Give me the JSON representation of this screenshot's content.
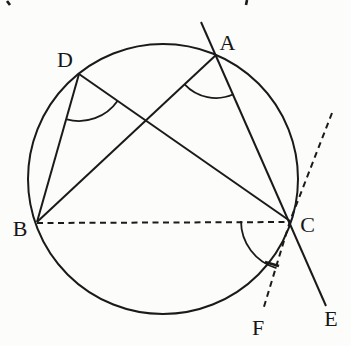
{
  "figure": {
    "background": "#fcfcfa",
    "ink": "#1a1a1a",
    "width": 351,
    "height": 346,
    "circle": {
      "cx": 163,
      "cy": 179,
      "r": 135
    },
    "points": {
      "A": {
        "x": 216,
        "y": 55
      },
      "B": {
        "x": 37,
        "y": 222
      },
      "C": {
        "x": 290,
        "y": 221
      },
      "D": {
        "x": 79,
        "y": 74
      }
    },
    "labels": [
      {
        "id": "A",
        "text": "A",
        "x": 227.5,
        "y": 42.5
      },
      {
        "id": "B",
        "text": "B",
        "x": 20,
        "y": 228
      },
      {
        "id": "C",
        "text": "C",
        "x": 307.5,
        "y": 224
      },
      {
        "id": "D",
        "text": "D",
        "x": 65,
        "y": 59
      },
      {
        "id": "E",
        "text": "E",
        "x": 331,
        "y": 318
      },
      {
        "id": "F",
        "text": "F",
        "x": 258,
        "y": 327
      }
    ],
    "solid_lines": [
      {
        "name": "secant-line-A-C-E",
        "x1": 201,
        "y1": 22,
        "x2": 326,
        "y2": 306
      },
      {
        "name": "chord-A-B",
        "x1": 216,
        "y1": 55,
        "x2": 37,
        "y2": 222
      },
      {
        "name": "chord-D-B",
        "x1": 79,
        "y1": 74,
        "x2": 37,
        "y2": 222
      },
      {
        "name": "chord-D-C",
        "x1": 79,
        "y1": 74,
        "x2": 290,
        "y2": 221
      }
    ],
    "dashed_lines": [
      {
        "name": "dashed-segment-B-C",
        "x1": 37,
        "y1": 223,
        "x2": 290,
        "y2": 222
      }
    ],
    "dashed_polylines": [
      {
        "name": "dashed-line-through-C-to-F",
        "points": [
          [
            332,
            113
          ],
          [
            290,
            221
          ],
          [
            263,
            310
          ]
        ]
      }
    ],
    "angle_arcs": [
      {
        "name": "angle-arc-at-A-BAC",
        "cx": 216,
        "cy": 55,
        "r": 43,
        "start_deg": 66,
        "end_deg": 137
      },
      {
        "name": "angle-arc-at-D-BDC",
        "cx": 79,
        "cy": 74,
        "r": 47,
        "start_deg": 35,
        "end_deg": 105
      },
      {
        "name": "angle-arc-at-C-BCF",
        "cx": 290,
        "cy": 221,
        "r": 49,
        "start_deg": 106,
        "end_deg": 180
      }
    ],
    "tick_marks": [
      {
        "name": "tick-on-angle-arc-at-C",
        "x1": 265,
        "y1": 262,
        "x2": 279,
        "y2": 266
      }
    ],
    "stray_marks": [
      {
        "name": "stray-ink-top-left",
        "x1": 7,
        "y1": 1,
        "x2": 10,
        "y2": 5
      },
      {
        "name": "stray-ink-top-right",
        "x1": 247,
        "y1": 0,
        "x2": 246,
        "y2": 5
      }
    ],
    "stroke_width": 2,
    "dash_pattern": "6 4.5"
  }
}
